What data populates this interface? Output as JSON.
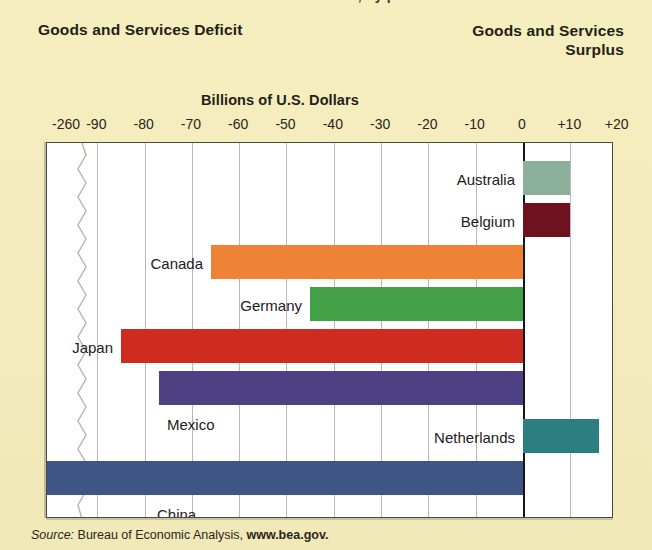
{
  "page": {
    "background_color": "#f5edbb",
    "clipped_top_fragment": "U.S. Trade in Goods and Services, by partner"
  },
  "header": {
    "left_title": "Goods and Services Deficit",
    "right_title_line1": "Goods and Services",
    "right_title_line2": "Surplus"
  },
  "source": {
    "label": "Source:",
    "text": "Bureau of Economic Analysis,",
    "url": "www.bea.gov."
  },
  "chart_data": {
    "type": "bar",
    "orientation": "horizontal",
    "title": "Billions of U.S. Dollars",
    "xlabel": "Billions of U.S. Dollars",
    "ylabel": "",
    "grid": true,
    "legend": "none",
    "axis_break": {
      "present": true,
      "between": [
        -260,
        -90
      ],
      "style": "zigzag"
    },
    "xlim": [
      -260,
      20
    ],
    "tick_labels": [
      "-260",
      "-90",
      "-80",
      "-70",
      "-60",
      "-50",
      "-40",
      "-30",
      "-20",
      "-10",
      "0",
      "+10",
      "+20"
    ],
    "tick_values": [
      -260,
      -90,
      -80,
      -70,
      -60,
      -50,
      -40,
      -30,
      -20,
      -10,
      0,
      10,
      20
    ],
    "categories": [
      "Australia",
      "Belgium",
      "Canada",
      "Germany",
      "Japan",
      "Mexico",
      "Netherlands",
      "China"
    ],
    "values": [
      10,
      10,
      -66,
      -45,
      -85,
      -77,
      16,
      -260
    ],
    "colors": [
      "#8cb09b",
      "#6e1220",
      "#ee8235",
      "#44a047",
      "#cf2b20",
      "#4d4184",
      "#2b7f80",
      "#3f5585"
    ],
    "label_side": [
      "left",
      "left",
      "left",
      "left",
      "left",
      "below-left",
      "left",
      "below-left"
    ]
  }
}
